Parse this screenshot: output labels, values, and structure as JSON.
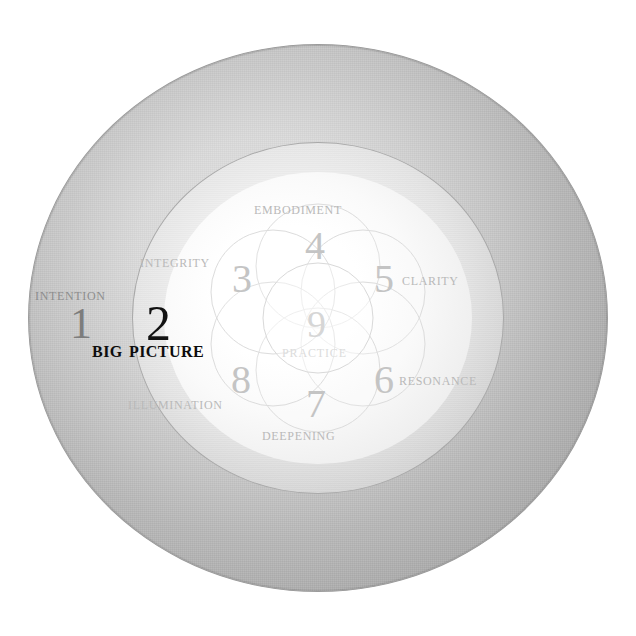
{
  "diagram": {
    "colors": {
      "outer_ring": "#bdbdbd",
      "middle_ring": "#e6e6e6",
      "inner_glow": "#ffffff",
      "petal_stroke": "#dcdcdc",
      "label_light": "#b9b9b9",
      "label_dark": "#8d8d8d",
      "feature_text": "#0d0d0d"
    },
    "stages": [
      {
        "number": "1",
        "label": "Intention",
        "ring": "outer",
        "tone": "dark"
      },
      {
        "number": "2",
        "label": "Big Picture",
        "ring": "middle",
        "tone": "black"
      },
      {
        "number": "3",
        "label": "Integrity",
        "ring": "petal",
        "tone": "light"
      },
      {
        "number": "4",
        "label": "Embodiment",
        "ring": "petal",
        "tone": "light"
      },
      {
        "number": "5",
        "label": "Clarity",
        "ring": "petal",
        "tone": "light"
      },
      {
        "number": "6",
        "label": "Resonance",
        "ring": "petal",
        "tone": "light"
      },
      {
        "number": "7",
        "label": "Deepening",
        "ring": "petal",
        "tone": "light"
      },
      {
        "number": "8",
        "label": "Illumination",
        "ring": "petal",
        "tone": "light"
      },
      {
        "number": "9",
        "label": "Practice",
        "ring": "center",
        "tone": "light"
      }
    ]
  }
}
